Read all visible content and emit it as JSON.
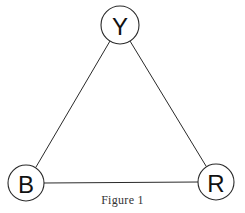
{
  "figure": {
    "caption": "Figure 1",
    "nodes": [
      {
        "id": "Y",
        "label": "Y",
        "cx": 120,
        "cy": 25,
        "r": 19
      },
      {
        "id": "B",
        "label": "B",
        "cx": 26,
        "cy": 183,
        "r": 18
      },
      {
        "id": "R",
        "label": "R",
        "cx": 216,
        "cy": 182,
        "r": 18
      }
    ],
    "edges": [
      {
        "from": "Y",
        "to": "B"
      },
      {
        "from": "Y",
        "to": "R"
      },
      {
        "from": "B",
        "to": "R"
      }
    ],
    "colors": {
      "stroke": "#2a2a2a",
      "background": "#ffffff",
      "text": "#111111"
    }
  }
}
